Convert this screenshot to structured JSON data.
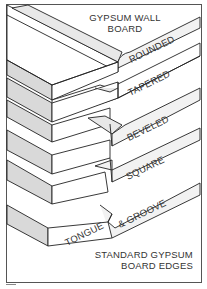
{
  "figure": {
    "title_line1": "GYPSUM WALL",
    "title_line2": "BOARD",
    "caption_line1": "STANDARD GYPSUM",
    "caption_line2": "BOARD EDGES",
    "edge_types": [
      {
        "label": "ROUNDED"
      },
      {
        "label": "TAPERED"
      },
      {
        "label": "BEVELED"
      },
      {
        "label": "SQUARE"
      },
      {
        "label": "TONGUE"
      },
      {
        "label": "& GROOVE"
      }
    ],
    "colors": {
      "line": "#222222",
      "face": "#ffffff",
      "side": "#d9d9d9",
      "edge_shade": "#e8e8e8",
      "border": "#555555"
    }
  }
}
